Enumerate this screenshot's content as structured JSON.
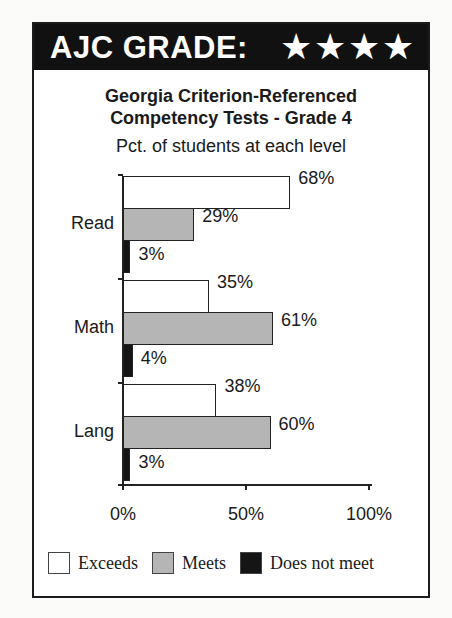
{
  "header": {
    "label": "AJC GRADE:",
    "stars": "★★★★",
    "star_count": 4
  },
  "title_line1": "Georgia Criterion-Referenced",
  "title_line2": "Competency Tests - Grade 4",
  "subtitle": "Pct. of students at each level",
  "colors": {
    "exceeds": "#ffffff",
    "meets": "#b5b5b5",
    "does_not_meet": "#151515",
    "header_bg": "#111111"
  },
  "legend": [
    {
      "label": "Exceeds",
      "color": "#ffffff"
    },
    {
      "label": "Meets",
      "color": "#b5b5b5"
    },
    {
      "label": "Does not meet",
      "color": "#151515"
    }
  ],
  "xticks": [
    "0%",
    "50%",
    "100%"
  ],
  "categories_display": [
    "Read",
    "Math",
    "Lang"
  ],
  "value_labels": {
    "Read": [
      "68%",
      "29%",
      "3%"
    ],
    "Math": [
      "35%",
      "61%",
      "4%"
    ],
    "Lang": [
      "38%",
      "60%",
      "3%"
    ]
  },
  "chart_data": {
    "type": "bar",
    "orientation": "horizontal",
    "title": "Georgia Criterion-Referenced Competency Tests - Grade 4",
    "subtitle": "Pct. of students at each level",
    "categories": [
      "Read",
      "Math",
      "Lang"
    ],
    "series": [
      {
        "name": "Exceeds",
        "values": [
          68,
          35,
          38
        ],
        "color": "#ffffff"
      },
      {
        "name": "Meets",
        "values": [
          29,
          61,
          60
        ],
        "color": "#b5b5b5"
      },
      {
        "name": "Does not meet",
        "values": [
          3,
          4,
          3
        ],
        "color": "#151515"
      }
    ],
    "xlabel": "",
    "ylabel": "",
    "xlim": [
      0,
      100
    ],
    "xticks": [
      "0%",
      "50%",
      "100%"
    ],
    "grid": false,
    "legend_position": "bottom",
    "data_labels": true
  }
}
